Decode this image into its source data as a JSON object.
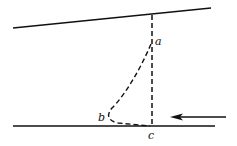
{
  "diagram": {
    "labels": {
      "a": "a",
      "b": "b",
      "c": "c"
    },
    "colors": {
      "stroke": "#111111",
      "background": "#ffffff"
    },
    "elements": [
      "upper-boundary-line",
      "lower-boundary-line",
      "vertical-dashed-line-a-c",
      "dashed-curve-a-b-c",
      "flow-arrow-left"
    ]
  }
}
